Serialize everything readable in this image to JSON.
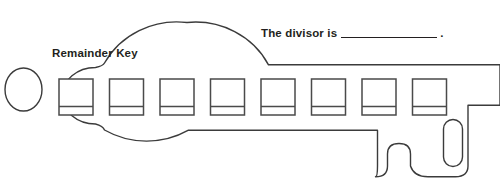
{
  "worksheet": {
    "title": "Remainder Key",
    "divisor_prompt": {
      "prefix": "The divisor is",
      "blank": "",
      "suffix": "."
    },
    "answer_boxes": {
      "count": 8,
      "values": [
        "",
        "",
        "",
        "",
        "",
        "",
        "",
        ""
      ]
    },
    "colors": {
      "outline": "#3b3b3b",
      "box_stroke": "#4a4a4a",
      "text": "#231f20",
      "background": "#ffffff"
    },
    "shape": {
      "name": "key",
      "bow": "circle",
      "ring_hole": "ellipse",
      "teeth": "notched-bit"
    }
  }
}
